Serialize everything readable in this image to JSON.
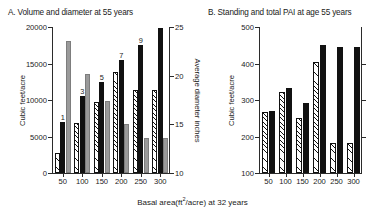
{
  "figure": {
    "xaxis_label_prefix": "Basal area(ft",
    "xaxis_label_exponent": "2",
    "xaxis_label_suffix": "/acre) at 32 years"
  },
  "panels": {
    "a": {
      "title": "A. Volume and diameter at 55 years",
      "ylabel_left": "Cubic feet/acre",
      "ylabel_right": "Average diameter inches"
    },
    "b": {
      "title": "B. Standing and total PAI at age 55 years",
      "ylabel_left": "Cubic feet/acre"
    }
  },
  "chart_data": [
    {
      "type": "bar",
      "panel": "A",
      "title": "A. Volume and diameter at 55 years",
      "xlabel": "Basal area(ft2/acre) at 32 years",
      "ylabel": "Cubic feet/acre",
      "y2label": "Average diameter inches",
      "categories": [
        "50",
        "100",
        "150",
        "200",
        "250",
        "300"
      ],
      "ylim": [
        0,
        20000
      ],
      "yticks": [
        0,
        5000,
        10000,
        15000,
        20000
      ],
      "y2lim": [
        10,
        25
      ],
      "y2ticks": [
        10,
        15,
        20,
        25
      ],
      "grid": false,
      "legend": "none",
      "series": [
        {
          "name": "hatched-bar",
          "style": "hatched",
          "axis": "left",
          "values": [
            2700,
            6900,
            9700,
            13900,
            11400,
            11400
          ]
        },
        {
          "name": "black-bar",
          "style": "solid-black",
          "axis": "left",
          "values": [
            7000,
            10600,
            12500,
            15500,
            17500,
            19800
          ]
        },
        {
          "name": "gray-bar",
          "style": "gray",
          "axis": "right",
          "values": [
            23.6,
            20.2,
            17.4,
            15.0,
            13.6,
            13.6
          ]
        }
      ],
      "bar_labels": [
        "1",
        "3",
        "5",
        "7",
        "9"
      ]
    },
    {
      "type": "bar",
      "panel": "B",
      "title": "B. Standing and total PAI at age 55 years",
      "xlabel": "Basal area(ft2/acre) at 32 years",
      "ylabel": "Cubic feet/acre",
      "categories": [
        "50",
        "100",
        "150",
        "200",
        "250",
        "300"
      ],
      "ylim": [
        100,
        500
      ],
      "yticks": [
        100,
        200,
        300,
        400,
        500
      ],
      "grid": false,
      "legend": "none",
      "series": [
        {
          "name": "standing-pai",
          "style": "hatched",
          "values": [
            268,
            323,
            252,
            405,
            181,
            181
          ]
        },
        {
          "name": "total-pai",
          "style": "solid-black",
          "values": [
            270,
            332,
            292,
            450,
            444,
            444
          ]
        }
      ]
    }
  ]
}
